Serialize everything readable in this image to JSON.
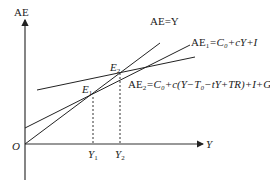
{
  "diagram": {
    "axes": {
      "y_label": "AE",
      "x_label": "Y",
      "origin_label": "O"
    },
    "lines": [
      {
        "name": "AE=Y",
        "label": "AE=Y",
        "from": [
          25,
          144
        ],
        "to": [
          160,
          43
        ]
      },
      {
        "name": "AE1",
        "label": "AE₁=C₀+cY+I",
        "from": [
          25,
          128
        ],
        "to": [
          190,
          45
        ]
      },
      {
        "name": "AE2",
        "label": "AE₂=C₀+c(Y−T₀−tY+TR)+I+G",
        "from": [
          37,
          90
        ],
        "to": [
          195,
          57
        ]
      }
    ],
    "points": [
      {
        "name": "E1",
        "label": "E₁",
        "x": 93,
        "y": 97
      },
      {
        "name": "E2",
        "label": "E₂",
        "x": 120,
        "y": 73
      }
    ],
    "x_ticks": [
      {
        "label": "Y₁",
        "x": 93
      },
      {
        "label": "Y₂",
        "x": 120
      }
    ],
    "labels": {
      "ae_eq_y": "AE=Y",
      "ae1": "AE",
      "ae1_sub": "1",
      "ae1_rest": "=C₀+cY+I",
      "ae2": "AE",
      "ae2_sub": "2",
      "ae2_rest": "=C₀+c(Y−T₀−tY+TR)+I+G",
      "e1": "E",
      "e1_sub": "1",
      "e2": "E",
      "e2_sub": "2",
      "y1": "Y",
      "y1_sub": "1",
      "y2": "Y",
      "y2_sub": "2"
    }
  }
}
